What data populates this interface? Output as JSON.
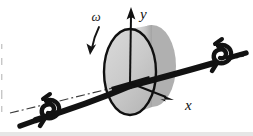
{
  "figure": {
    "kind": "mechanics-line-diagram",
    "background_color": "#ffffff",
    "ink_color": "#111111",
    "labels": {
      "y_axis": "y",
      "x_axis": "x",
      "angular_velocity": "ω"
    },
    "colors": {
      "disk_body": "#b9b9b9",
      "disk_face_highlight": "#d2d2d2",
      "disk_shadow": "#9d9d9d",
      "outline": "#111111",
      "centerline": "#3a3a3a",
      "scan_edge": "#e2e2e2"
    },
    "parts": {
      "disk_label": "rotating disk",
      "shaft_label": "shaft",
      "bearing_left_label": "left bearing",
      "bearing_right_label": "right bearing",
      "centerline_label": "shaft centerline",
      "origin_label": "origin"
    },
    "geometry": {
      "origin": [
        130,
        83
      ],
      "y_axis_tip": [
        131,
        10
      ],
      "x_axis_tip": [
        172,
        100
      ],
      "disk_center": [
        130,
        72
      ],
      "disk_rx": 26,
      "disk_ry": 43
    }
  }
}
